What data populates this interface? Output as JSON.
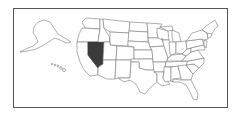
{
  "map": {
    "type": "us-locator-map",
    "highlighted_state": "Nevada",
    "highlight_color": "#3b3b3b",
    "base_color": "#ffffff",
    "border_color": "#7a7a7a",
    "frame_color": "#555555",
    "insets": [
      "Alaska",
      "Hawaii"
    ]
  }
}
